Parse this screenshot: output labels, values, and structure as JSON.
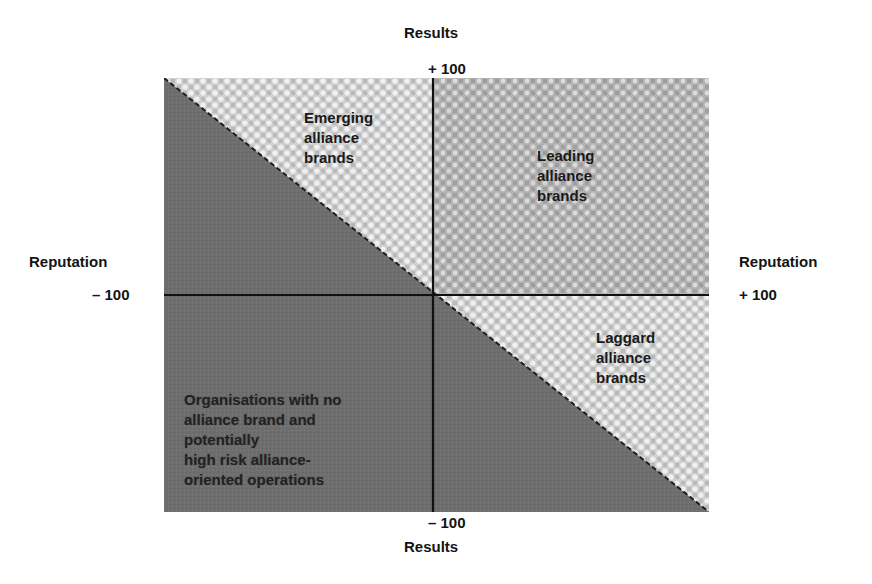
{
  "diagram": {
    "type": "quadrant-matrix",
    "axes": {
      "vertical": {
        "name_top": "Results",
        "name_bottom": "Results",
        "max_label": "+ 100",
        "min_label": "– 100"
      },
      "horizontal": {
        "name_left": "Reputation",
        "name_right": "Reputation",
        "min_label": "– 100",
        "max_label": "+ 100"
      }
    },
    "regions": {
      "emerging": "Emerging\nalliance\nbrands",
      "leading": "Leading\nalliance\nbrands",
      "laggard": "Laggard\nalliance\nbrands",
      "no_brand": "Organisations with no\nalliance brand and\npotentially\nhigh risk alliance-\noriented operations"
    },
    "colors": {
      "dark_region": "#6c6c6c",
      "light_region": "#d2d2d2",
      "medium_region": "#b0b0b0",
      "axis_line": "#111111",
      "diagonal": "#222222"
    }
  }
}
